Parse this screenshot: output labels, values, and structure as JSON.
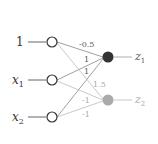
{
  "inputs": [
    {
      "label": "1",
      "sub": ""
    },
    {
      "label": "x",
      "sub": "1"
    },
    {
      "label": "x",
      "sub": "2"
    }
  ],
  "outputs": [
    {
      "label": "z",
      "sub": "1",
      "color": "#333333"
    },
    {
      "label": "z",
      "sub": "2",
      "color": "#aaaaaa"
    }
  ],
  "weights": {
    "w_1_z1": "-0.5",
    "w_x1_z1": "1",
    "w_x2_z1": "1",
    "w_1_z2": "1.5",
    "w_x1_z2": "-1",
    "w_x2_z2": "-1"
  }
}
